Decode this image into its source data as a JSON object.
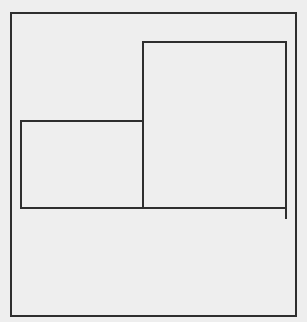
{
  "canvas": {
    "width": 307,
    "height": 322,
    "background": "#eeeeee",
    "stroke_color": "#2e2e2e",
    "stroke_width": 2
  },
  "shapes": {
    "outer_frame": {
      "x1": 11,
      "y1": 13,
      "x2": 296,
      "y2": 316
    },
    "right_block": {
      "x1": 143,
      "y1": 42,
      "x2": 286,
      "y2": 208
    },
    "left_block": {
      "x1": 21,
      "y1": 121,
      "x2": 143,
      "y2": 208
    },
    "right_tail": {
      "x": 286,
      "y1": 208,
      "y2": 219
    }
  }
}
